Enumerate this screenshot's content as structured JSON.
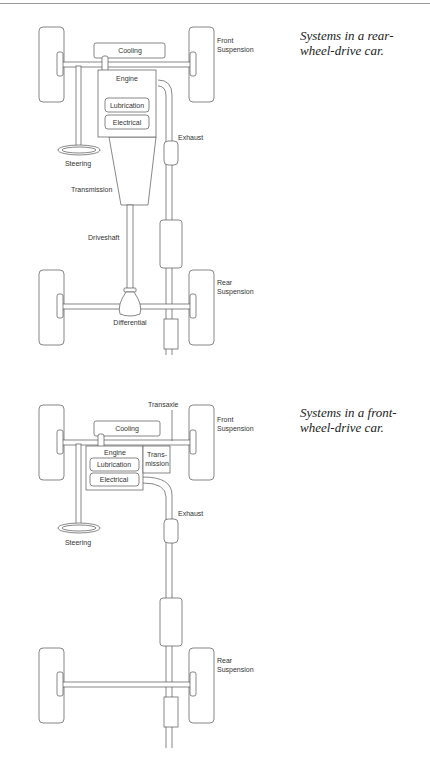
{
  "diagrams": [
    {
      "id": "rear-wheel-drive",
      "caption": "Systems in a rear-wheel-drive car.",
      "caption_lines": [
        "Systems in a rear-",
        "wheel-drive car."
      ],
      "labels": {
        "cooling": "Cooling",
        "engine": "Engine",
        "lubrication": "Lubrication",
        "electrical": "Electrical",
        "steering": "Steering",
        "transmission": "Transmission",
        "driveshaft": "Driveshaft",
        "differential": "Differential",
        "exhaust": "Exhaust",
        "front_suspension_1": "Front",
        "front_suspension_2": "Suspension",
        "rear_suspension_1": "Rear",
        "rear_suspension_2": "Suspension"
      }
    },
    {
      "id": "front-wheel-drive",
      "caption": "Systems in a front-wheel-drive car.",
      "caption_lines": [
        "Systems in a front-",
        "wheel-drive car."
      ],
      "labels": {
        "transaxle": "Transaxle",
        "cooling": "Cooling",
        "engine": "Engine",
        "lubrication": "Lubrication",
        "electrical": "Electrical",
        "transmission_1": "Trans-",
        "transmission_2": "mission",
        "steering": "Steering",
        "exhaust": "Exhaust",
        "front_suspension_1": "Front",
        "front_suspension_2": "Suspension",
        "rear_suspension_1": "Rear",
        "rear_suspension_2": "Suspension"
      }
    }
  ]
}
